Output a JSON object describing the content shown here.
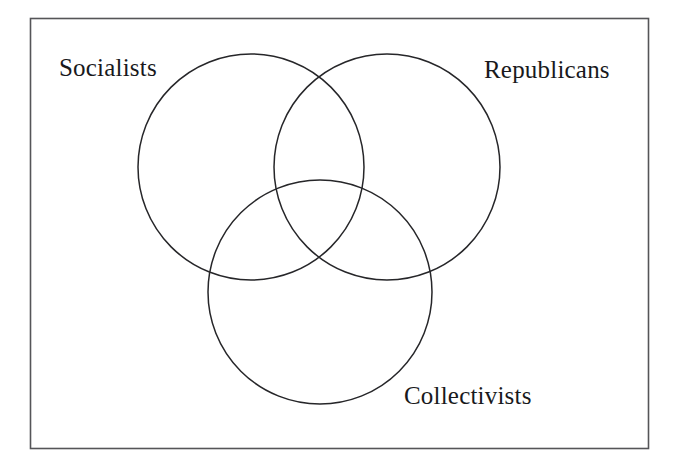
{
  "figure": {
    "type": "venn-diagram",
    "set_count": 3,
    "background_color": "#ffffff",
    "stroke_color": "#262629",
    "frame_color": "#555558",
    "label_color": "#19191c"
  },
  "frame": {
    "name": "figure-border",
    "left": 30,
    "top": 18,
    "width": 618,
    "height": 430
  },
  "labels": {
    "socialists": "Socialists",
    "republicans": "Republicans",
    "collectivists": "Collectivists"
  },
  "chart_data": {
    "type": "venn",
    "title": "",
    "sets": [
      {
        "id": "socialists",
        "label": "Socialists",
        "cx": 251,
        "cy": 167,
        "r": 113,
        "label_position": "upper-left"
      },
      {
        "id": "republicans",
        "label": "Republicans",
        "cx": 387,
        "cy": 167,
        "r": 113,
        "label_position": "upper-right"
      },
      {
        "id": "collectivists",
        "label": "Collectivists",
        "cx": 320,
        "cy": 292,
        "r": 112,
        "label_position": "lower-right"
      }
    ],
    "regions": [
      "Socialists only",
      "Republicans only",
      "Collectivists only",
      "Socialists ∩ Republicans",
      "Socialists ∩ Collectivists",
      "Republicans ∩ Collectivists",
      "Socialists ∩ Republicans ∩ Collectivists"
    ],
    "values": [],
    "legend": "none",
    "grid": false,
    "filled": false,
    "xlabel": "",
    "ylabel": ""
  }
}
